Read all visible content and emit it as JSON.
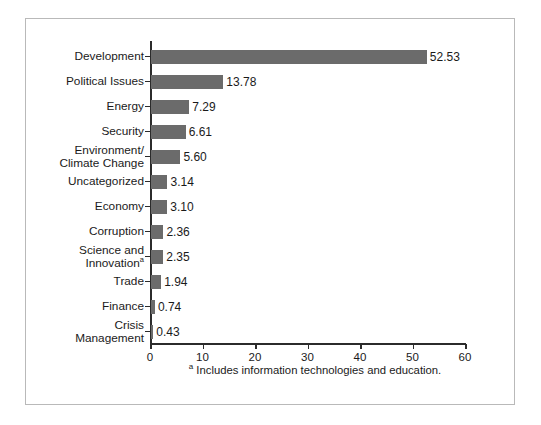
{
  "chart_data": {
    "type": "bar",
    "orientation": "horizontal",
    "title": "",
    "subtitle": "",
    "xlabel": "",
    "ylabel": "",
    "xlim": [
      0,
      60
    ],
    "ylim": null,
    "grid": false,
    "legend": null,
    "bar_color": "#6b6b6b",
    "axis_color": "#2b2b2b",
    "background_color": "#ffffff",
    "frame_color": "#b9b9b9",
    "xticks": [
      0,
      10,
      20,
      30,
      40,
      50,
      60
    ],
    "xtick_labels": [
      "0",
      "10",
      "20",
      "30",
      "40",
      "50",
      "60"
    ],
    "categories": [
      "Development",
      "Political Issues",
      "Energy",
      "Security",
      "Environment/\nClimate Change",
      "Uncategorized",
      "Economy",
      "Corruption",
      "Science and\nInnovation",
      "Trade",
      "Finance",
      "Crisis\nManagement"
    ],
    "values": [
      52.53,
      13.78,
      7.29,
      6.61,
      5.6,
      3.14,
      3.1,
      2.36,
      2.35,
      1.94,
      0.74,
      0.43
    ],
    "value_labels": [
      "52.53",
      "13.78",
      "7.29",
      "6.61",
      "5.60",
      "3.14",
      "3.10",
      "2.36",
      "2.35",
      "1.94",
      "0.74",
      "0.43"
    ],
    "footnote_marks": {
      "science_and_innovation": "a"
    },
    "annotations": [
      {
        "text": "Includes information technologies and education.",
        "mark": "a"
      }
    ]
  },
  "footnote": {
    "mark": "a",
    "text": "Includes information technologies and education."
  }
}
